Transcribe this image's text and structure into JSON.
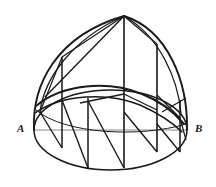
{
  "figure": {
    "kind": "line-drawing",
    "canvas": {
      "width": 216,
      "height": 187,
      "background": "#ffffff"
    },
    "stroke": {
      "main": "#1a1a1a",
      "thin": "#6e6e6e",
      "width_outline": 1.6,
      "width_band": 1.9,
      "width_generator": 1.4,
      "width_diagonal": 1.3,
      "width_axis": 0.8
    },
    "labels": {
      "left": "A",
      "right": "B"
    },
    "points": {
      "apex": {
        "x": 124,
        "y": 16
      },
      "A": {
        "x": 34,
        "y": 130
      },
      "B": {
        "x": 187,
        "y": 130
      },
      "base_center": {
        "x": 110.5,
        "y": 130
      },
      "base_rx": 76.5,
      "base_ry": 40
    },
    "generators_x": [
      62,
      88,
      124,
      157,
      180
    ],
    "geometry_notes": {
      "base": "ellipse centered (110.5,130) rx 76.5 ry 40",
      "chord_AB": "horizontal segment from A(34,130) to B(187,130)",
      "band": "slanted elliptical band crossing the dome between the left rim and the lower right"
    }
  }
}
